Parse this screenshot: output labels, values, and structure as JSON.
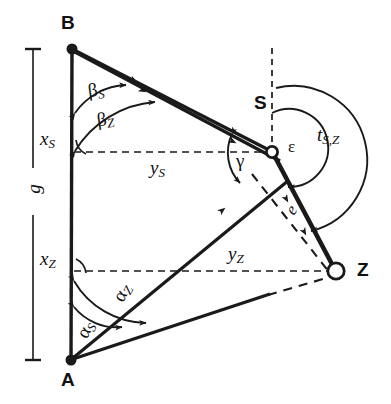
{
  "figure": {
    "type": "geometric-survey-diagram",
    "stroke_color": "#1a1a1a",
    "background_color": "#ffffff"
  },
  "points": [
    {
      "id": "B",
      "label": "B",
      "marker": "filled-dot",
      "x": 72,
      "y": 49
    },
    {
      "id": "A",
      "label": "A",
      "marker": "filled-dot",
      "x": 71,
      "y": 360
    },
    {
      "id": "S",
      "label": "S",
      "marker": "open-circle",
      "x": 272,
      "y": 152
    },
    {
      "id": "Z",
      "label": "Z",
      "marker": "open-circle",
      "x": 336,
      "y": 271
    }
  ],
  "labels": {
    "point_b": "B",
    "point_a": "A",
    "point_s": "S",
    "point_z": "Z",
    "baseline_g": "g",
    "x_s": "x",
    "x_s_sub": "S",
    "x_z": "x",
    "x_z_sub": "Z",
    "y_s": "y",
    "y_s_sub": "S",
    "y_z": "y",
    "y_z_sub": "Z",
    "beta_s": "β",
    "beta_s_sub": "S",
    "beta_z": "β",
    "beta_z_sub": "Z",
    "alpha_s": "α",
    "alpha_s_sub": "S",
    "alpha_z": "α",
    "alpha_z_sub": "Z",
    "gamma": "γ",
    "epsilon": "ε",
    "t_sz": "t",
    "t_sz_sub": "S,Z",
    "distance_e": "e"
  },
  "segments": [
    {
      "name": "baseline-AB",
      "from": "A",
      "to": "B",
      "style": "solid-thick"
    },
    {
      "name": "line-B-to-S",
      "from": "B",
      "to": "S",
      "style": "solid-thick"
    },
    {
      "name": "line-B-to-Z",
      "from": "B",
      "to": "Z",
      "style": "solid-thick"
    },
    {
      "name": "line-A-to-S",
      "from": "A",
      "to": "S",
      "style": "solid-thick"
    },
    {
      "name": "line-A-to-Z",
      "from": "A",
      "to": "Z",
      "style": "solid-then-dashed"
    },
    {
      "name": "line-S-to-Z",
      "from": "S",
      "to": "Z",
      "style": "solid-very-thick"
    },
    {
      "name": "chord-e-dashed",
      "from": "B-area",
      "to": "Z",
      "style": "dashed"
    },
    {
      "name": "ordinate-x-S",
      "from": "baseline",
      "to": "S",
      "style": "dashed-horizontal"
    },
    {
      "name": "ordinate-x-Z",
      "from": "baseline",
      "to": "Z",
      "style": "dashed-horizontal"
    },
    {
      "name": "meridian-at-S",
      "from": "S",
      "to": "north",
      "style": "dashed-vertical"
    }
  ],
  "angles": [
    {
      "name": "beta_S",
      "at": "B",
      "label": "βS",
      "description": "angle at B to S from baseline"
    },
    {
      "name": "beta_Z",
      "at": "B",
      "label": "βZ",
      "description": "angle at B to Z from baseline"
    },
    {
      "name": "alpha_S",
      "at": "A",
      "label": "αS",
      "description": "angle at A to S from baseline"
    },
    {
      "name": "alpha_Z",
      "at": "A",
      "label": "αZ",
      "description": "angle at A to Z from baseline"
    },
    {
      "name": "gamma",
      "at": "S",
      "label": "γ",
      "description": "angle at S between rays to A and B"
    },
    {
      "name": "epsilon",
      "at": "S",
      "label": "ε",
      "description": "angle at S from north to Z"
    },
    {
      "name": "t_S_Z",
      "at": "S",
      "label": "tS,Z",
      "description": "bearing from S to Z"
    }
  ],
  "scale_bar": {
    "name": "baseline-length-g",
    "label": "g",
    "x": 33,
    "y_top": 49,
    "y_bottom": 360
  }
}
